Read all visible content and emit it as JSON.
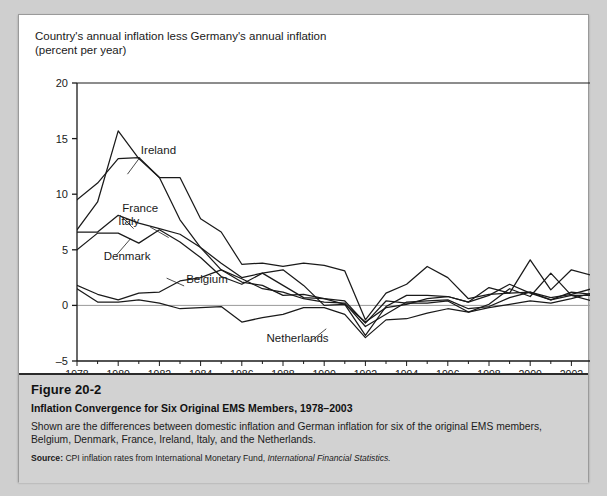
{
  "figure": {
    "number": "Figure 20-2",
    "title": "Inflation Convergence for Six Original EMS Members, 1978–2003",
    "description": "Shown are the differences between domestic inflation and German inflation for six of the original EMS members, Belgium, Denmark, France, Ireland, Italy, and the Netherlands.",
    "source_label": "Source:",
    "source_text": " CPI inflation rates from International Monetary Fund, ",
    "source_italic": "International Financial Statistics."
  },
  "chart_data": {
    "type": "line",
    "title": "",
    "axis_caption": "Country's annual inflation less Germany's annual inflation\n(percent per year)",
    "xlabel": "",
    "ylabel": "percent per year",
    "grid": false,
    "legend": "inline-labels",
    "zero_line": true,
    "xlim": [
      1978,
      2003
    ],
    "ylim": [
      -5,
      20
    ],
    "yticks": [
      -5,
      0,
      5,
      10,
      15,
      20
    ],
    "ytick_labels": [
      "–5",
      "0",
      "5",
      "10",
      "15",
      "20"
    ],
    "xticks": [
      1978,
      1979,
      1980,
      1981,
      1982,
      1983,
      1984,
      1985,
      1986,
      1987,
      1988,
      1989,
      1990,
      1991,
      1992,
      1993,
      1994,
      1995,
      1996,
      1997,
      1998,
      1999,
      2000,
      2001,
      2002,
      2003
    ],
    "xtick_labels_shown": [
      "1978",
      "1980",
      "1982",
      "1984",
      "1986",
      "1988",
      "1990",
      "1992",
      "1994",
      "1996",
      "1998",
      "2000",
      "2002"
    ],
    "x": [
      1978,
      1979,
      1980,
      1981,
      1982,
      1983,
      1984,
      1985,
      1986,
      1987,
      1988,
      1989,
      1990,
      1991,
      1992,
      1993,
      1994,
      1995,
      1996,
      1997,
      1998,
      1999,
      2000,
      2001,
      2002,
      2003
    ],
    "series": [
      {
        "name": "Italy",
        "label": "Italy",
        "color": "#1a1a1a",
        "label_x": 2.0,
        "label_y": 7.2,
        "values": [
          9.5,
          11.0,
          13.2,
          13.3,
          11.5,
          11.5,
          7.8,
          6.6,
          3.7,
          3.8,
          3.5,
          3.8,
          3.6,
          3.1,
          -1.3,
          1.1,
          1.9,
          3.5,
          2.5,
          0.6,
          1.0,
          1.1,
          1.2,
          0.7,
          1.0,
          1.5
        ]
      },
      {
        "name": "Ireland",
        "label": "Ireland",
        "color": "#1a1a1a",
        "label_x": 3.1,
        "label_y": 13.6,
        "values": [
          6.8,
          9.3,
          15.7,
          13.2,
          11.5,
          7.7,
          5.2,
          3.2,
          2.1,
          1.8,
          0.9,
          1.0,
          0.6,
          0.1,
          -2.7,
          -0.1,
          0.9,
          0.9,
          0.8,
          0.3,
          1.6,
          1.1,
          4.1,
          1.4,
          3.2,
          2.7
        ]
      },
      {
        "name": "France",
        "label": "France",
        "color": "#1a1a1a",
        "label_x": 2.2,
        "label_y": 8.4,
        "values": [
          6.6,
          6.6,
          8.1,
          7.4,
          6.9,
          6.4,
          5.2,
          3.8,
          2.5,
          2.9,
          1.8,
          0.7,
          0.6,
          0.4,
          -1.6,
          0.4,
          0.2,
          0.2,
          0.4,
          -0.6,
          -0.2,
          0.1,
          0.4,
          0.2,
          0.6,
          1.1
        ]
      },
      {
        "name": "Denmark",
        "label": "Denmark",
        "color": "#1a1a1a",
        "label_x": 1.3,
        "label_y": 4.1,
        "values": [
          5.0,
          6.5,
          6.5,
          5.6,
          6.8,
          5.7,
          4.3,
          2.6,
          1.9,
          2.9,
          3.2,
          1.8,
          0.0,
          0.1,
          -1.5,
          -0.2,
          0.1,
          0.6,
          0.8,
          0.3,
          0.9,
          1.9,
          1.1,
          0.5,
          1.2,
          1.0
        ]
      },
      {
        "name": "Belgium",
        "label": "Belgium",
        "color": "#1a1a1a",
        "label_x": 5.3,
        "label_y": 2.0,
        "values": [
          1.8,
          1.0,
          0.5,
          1.1,
          1.2,
          2.2,
          2.5,
          3.2,
          2.4,
          1.5,
          1.2,
          0.6,
          0.3,
          0.2,
          -1.9,
          -0.8,
          0.3,
          0.4,
          0.5,
          -0.3,
          -0.1,
          0.7,
          1.2,
          0.5,
          0.9,
          0.9
        ]
      },
      {
        "name": "Netherlands",
        "label": "Netherlands",
        "color": "#1a1a1a",
        "label_x": 9.2,
        "label_y": -3.3,
        "values": [
          1.5,
          0.3,
          0.3,
          0.5,
          0.2,
          -0.3,
          -0.2,
          -0.1,
          -1.5,
          -1.1,
          -0.8,
          -0.2,
          -0.2,
          -0.8,
          -2.9,
          -1.3,
          -1.2,
          -0.7,
          -0.3,
          -0.6,
          0.1,
          1.5,
          0.8,
          2.9,
          0.9,
          0.4
        ]
      }
    ]
  }
}
